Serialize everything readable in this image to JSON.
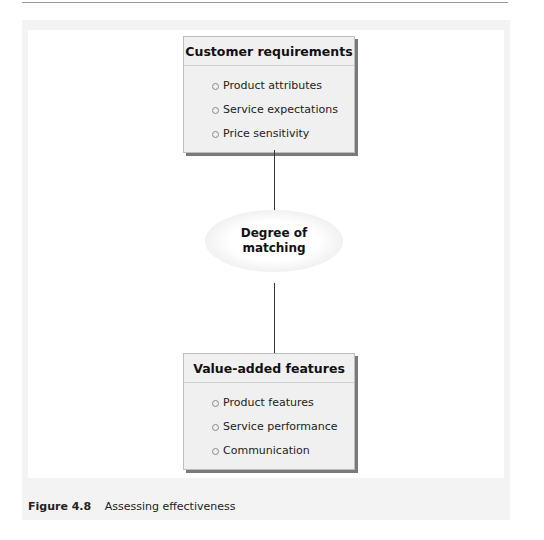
{
  "diagram": {
    "top_box": {
      "title": "Customer requirements",
      "items": [
        "Product attributes",
        "Service expectations",
        "Price sensitivity"
      ]
    },
    "center": {
      "line1": "Degree of",
      "line2": "matching"
    },
    "bottom_box": {
      "title": "Value-added features",
      "items": [
        "Product features",
        "Service performance",
        "Communication"
      ]
    }
  },
  "caption": {
    "figure_label": "Figure 4.8",
    "text": "Assessing effectiveness"
  }
}
